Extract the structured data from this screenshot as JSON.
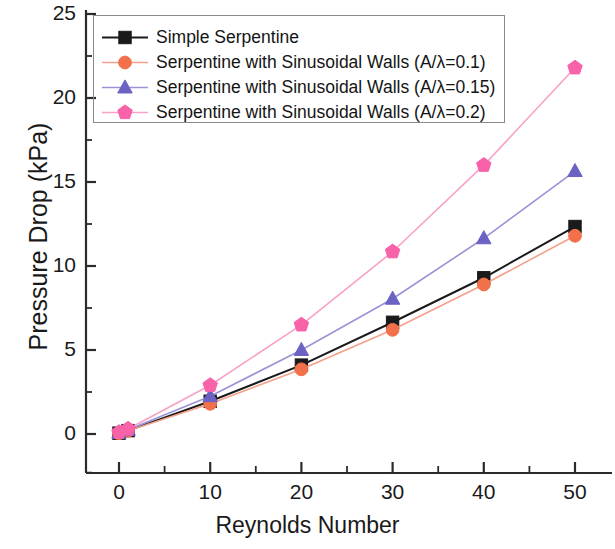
{
  "chart_data": {
    "type": "line",
    "title": "",
    "xlabel": "Reynolds Number",
    "ylabel": "Pressure Drop (kPa)",
    "xlim": [
      -5,
      55
    ],
    "ylim": [
      -2.5,
      25
    ],
    "xticks": [
      0,
      10,
      20,
      30,
      40,
      50
    ],
    "xtick_labels": [
      "0",
      "10",
      "20",
      "30",
      "40",
      "50"
    ],
    "yticks": [
      0,
      5,
      10,
      15,
      20,
      25
    ],
    "ytick_labels": [
      "0",
      "5",
      "10",
      "15",
      "20",
      "25"
    ],
    "x_minor_tick_step": 5,
    "y_minor_tick_step": 2.5,
    "grid": false,
    "legend_position": "upper left",
    "x": [
      0,
      1,
      10,
      20,
      30,
      40,
      50
    ],
    "series": [
      {
        "name": "Simple Serpentine",
        "label": "Simple Serpentine",
        "color": "#1a1a1a",
        "marker": "square",
        "values": [
          0.05,
          0.2,
          1.95,
          4.1,
          6.65,
          9.3,
          12.35
        ]
      },
      {
        "name": "Serpentine with Sinusoidal Walls (A/λ=0.1)",
        "label": "Serpentine with Sinusoidal Walls (A/λ=0.1)",
        "color": "#f2714a",
        "line_color": "#f4a08a",
        "marker": "circle",
        "values": [
          0.05,
          0.2,
          1.8,
          3.85,
          6.2,
          8.9,
          11.8
        ]
      },
      {
        "name": "Serpentine with Sinusoidal Walls (A/λ=0.15)",
        "label": "Serpentine with Sinusoidal Walls (A/λ=0.15)",
        "color": "#6b62c4",
        "line_color": "#9a93d6",
        "marker": "triangle",
        "values": [
          0.08,
          0.25,
          2.25,
          5.0,
          8.05,
          11.65,
          15.65
        ]
      },
      {
        "name": "Serpentine with Sinusoidal Walls (A/λ=0.2)",
        "label": "Serpentine with Sinusoidal Walls (A/λ=0.2)",
        "color": "#f762a8",
        "line_color": "#f9a0c8",
        "marker": "pentagon",
        "values": [
          0.1,
          0.3,
          2.9,
          6.5,
          10.85,
          16.0,
          21.8
        ]
      }
    ]
  },
  "axes": {
    "xlabel": "Reynolds Number",
    "ylabel": "Pressure Drop (kPa)"
  },
  "legend": {
    "items": [
      {
        "label": "Simple Serpentine"
      },
      {
        "label": "Serpentine with Sinusoidal Walls (A/λ=0.1)"
      },
      {
        "label": "Serpentine with Sinusoidal Walls (A/λ=0.15)"
      },
      {
        "label": "Serpentine with Sinusoidal Walls (A/λ=0.2)"
      }
    ]
  },
  "ticks": {
    "x": [
      "0",
      "10",
      "20",
      "30",
      "40",
      "50"
    ],
    "y": [
      "0",
      "5",
      "10",
      "15",
      "20",
      "25"
    ]
  }
}
